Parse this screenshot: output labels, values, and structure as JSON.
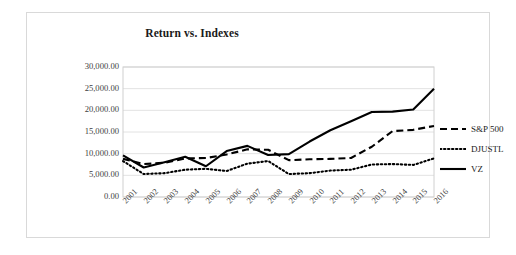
{
  "chart_data": {
    "type": "line",
    "title": "Return vs. Indexes",
    "xlabel": "",
    "ylabel": "",
    "grid": true,
    "legend_position": "right",
    "ylim": [
      0,
      30000
    ],
    "ytick_labels": [
      "30,000.00",
      "25,000.00",
      "20,000.00",
      "15,000.00",
      "10,000.00",
      "5,000.00",
      "0.00"
    ],
    "ytick_values": [
      30000,
      25000,
      20000,
      15000,
      10000,
      5000,
      0
    ],
    "categories": [
      "2001",
      "2002",
      "2003",
      "2004",
      "2005",
      "2006",
      "2007",
      "2008",
      "2009",
      "2010",
      "2011",
      "2012",
      "2013",
      "2014",
      "2015",
      "2016"
    ],
    "series": [
      {
        "name": "S&P 500",
        "style": "dashed",
        "color": "#000000",
        "values": [
          8800,
          7600,
          7900,
          8900,
          9000,
          9800,
          11000,
          10900,
          8500,
          8700,
          8800,
          9000,
          11600,
          15200,
          15500,
          16400
        ]
      },
      {
        "name": "DJUSTL",
        "style": "dotted",
        "color": "#000000",
        "values": [
          8300,
          5300,
          5500,
          6300,
          6500,
          6000,
          7700,
          8300,
          5300,
          5500,
          6100,
          6300,
          7500,
          7600,
          7400,
          8900
        ]
      },
      {
        "name": "VZ",
        "style": "solid",
        "color": "#000000",
        "values": [
          9600,
          6800,
          8000,
          9300,
          7100,
          10600,
          11800,
          9700,
          9900,
          12800,
          15400,
          17500,
          19600,
          19700,
          20200,
          25000
        ]
      }
    ]
  },
  "colors": {
    "frame_border": "#d9d9d9",
    "gridline": "#e2e2e2",
    "plot_border": "#d0d0d0",
    "text": "#1a1a1a",
    "axis_text": "#404040"
  }
}
